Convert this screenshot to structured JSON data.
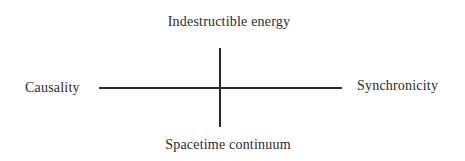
{
  "diagram": {
    "type": "quadrant-axes",
    "labels": {
      "top": "Indestructible energy",
      "bottom": "Spacetime continuum",
      "left": "Causality",
      "right": "Synchronicity"
    },
    "colors": {
      "background": "#ffffff",
      "ink": "#2a2a2a"
    }
  }
}
